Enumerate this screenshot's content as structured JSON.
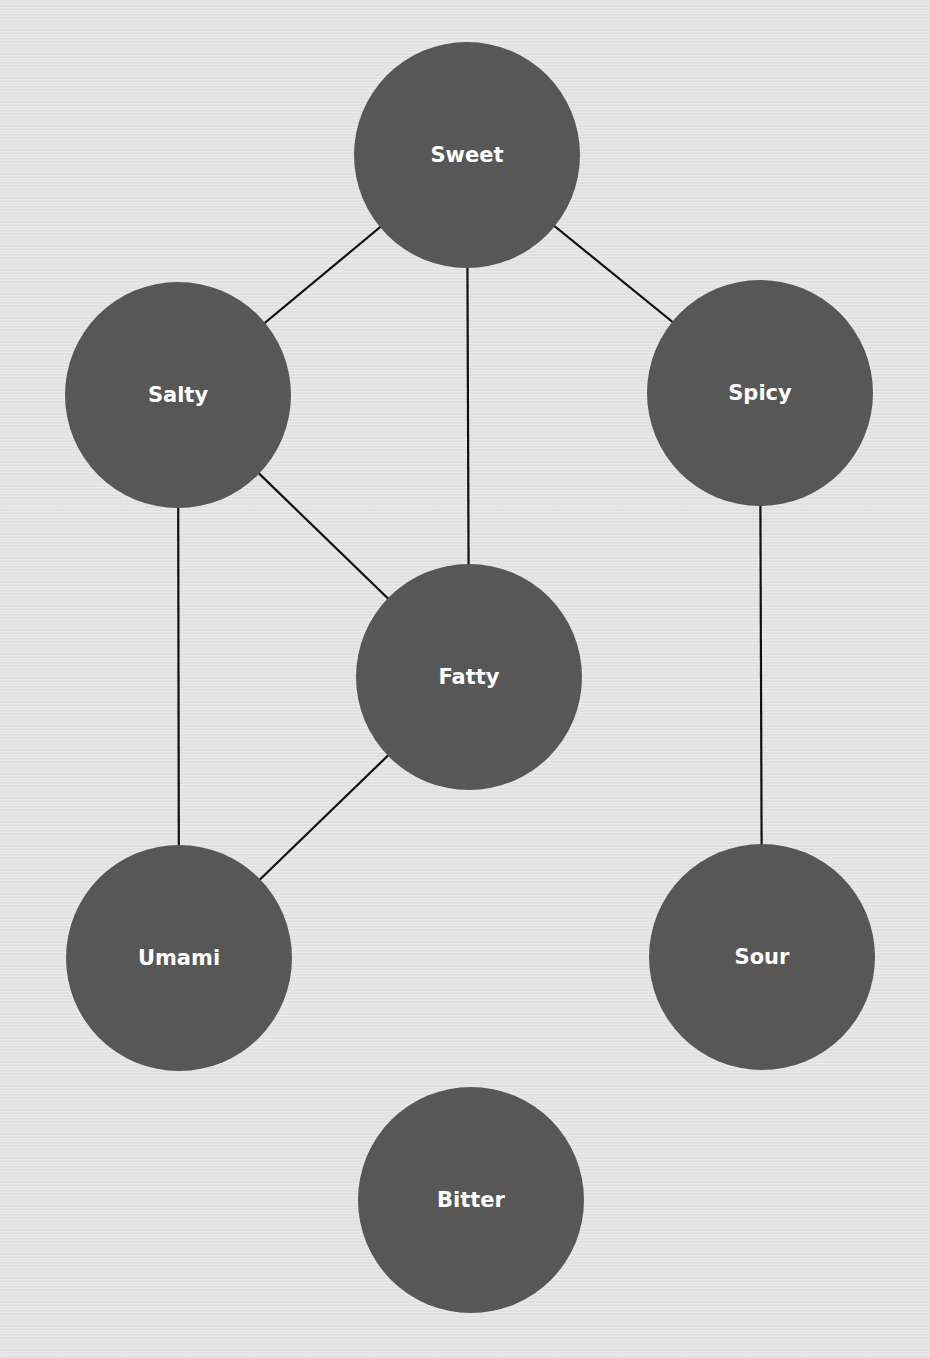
{
  "diagram": {
    "type": "undirected-graph",
    "colors": {
      "background": "#e5e5e5",
      "node_fill": "#575757",
      "node_label": "#ffffff",
      "edge": "#111111"
    },
    "node_radius": 113,
    "nodes": [
      {
        "id": "sweet",
        "label": "Sweet",
        "x": 467,
        "y": 155
      },
      {
        "id": "salty",
        "label": "Salty",
        "x": 178,
        "y": 395
      },
      {
        "id": "spicy",
        "label": "Spicy",
        "x": 760,
        "y": 393
      },
      {
        "id": "fatty",
        "label": "Fatty",
        "x": 469,
        "y": 677
      },
      {
        "id": "umami",
        "label": "Umami",
        "x": 179,
        "y": 958
      },
      {
        "id": "sour",
        "label": "Sour",
        "x": 762,
        "y": 957
      },
      {
        "id": "bitter",
        "label": "Bitter",
        "x": 471,
        "y": 1200
      }
    ],
    "edges": [
      {
        "from": "sweet",
        "to": "salty"
      },
      {
        "from": "sweet",
        "to": "fatty"
      },
      {
        "from": "sweet",
        "to": "spicy"
      },
      {
        "from": "salty",
        "to": "fatty"
      },
      {
        "from": "salty",
        "to": "umami"
      },
      {
        "from": "fatty",
        "to": "umami"
      },
      {
        "from": "spicy",
        "to": "sour"
      }
    ]
  }
}
